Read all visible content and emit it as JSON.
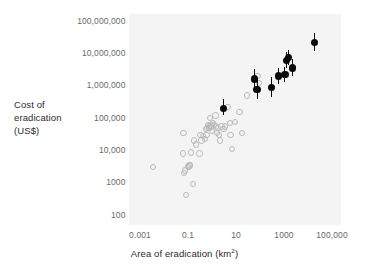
{
  "figure": {
    "background_color": "#ffffff",
    "plot_background_color": "#f4f4f4",
    "filled_marker_color": "#0a0a0a",
    "open_marker_color": "#b9b9b9",
    "tick_label_color": "#6a6a6a",
    "axis_title_color": "#2b2b2b"
  },
  "chart_data": {
    "type": "scatter",
    "title": "",
    "xlabel": "Area of eradication (km²)",
    "ylabel_lines": [
      "Cost of",
      "eradication",
      "(US$)"
    ],
    "ylabel": "Cost of eradication (US$)",
    "xscale": "log",
    "yscale": "log",
    "xlim": [
      0.001,
      100000
    ],
    "ylim": [
      100,
      100000000
    ],
    "grid": false,
    "legend": null,
    "xticks": [
      0.001,
      0.1,
      10,
      1000,
      100000
    ],
    "xtick_labels": [
      "0.001",
      "0.1",
      "10",
      "1000",
      "100,000"
    ],
    "yticks": [
      100,
      1000,
      10000,
      100000,
      1000000,
      10000000,
      100000000
    ],
    "ytick_labels": [
      "100",
      "1000",
      "10,000",
      "100,000",
      "1,000,000",
      "10,000,000",
      "100,000,000"
    ],
    "series": [
      {
        "name": "open-circles",
        "marker": "open-circle",
        "points": [
          {
            "x": 0.0035,
            "y": 3000
          },
          {
            "x": 0.065,
            "y": 35000
          },
          {
            "x": 0.062,
            "y": 8000
          },
          {
            "x": 0.07,
            "y": 2000
          },
          {
            "x": 0.075,
            "y": 2400
          },
          {
            "x": 0.085,
            "y": 420
          },
          {
            "x": 0.1,
            "y": 3000
          },
          {
            "x": 0.105,
            "y": 3200
          },
          {
            "x": 0.115,
            "y": 3400
          },
          {
            "x": 0.12,
            "y": 3500
          },
          {
            "x": 0.13,
            "y": 8500
          },
          {
            "x": 0.16,
            "y": 900
          },
          {
            "x": 0.18,
            "y": 20000
          },
          {
            "x": 0.22,
            "y": 15000
          },
          {
            "x": 0.3,
            "y": 8000
          },
          {
            "x": 0.33,
            "y": 30000
          },
          {
            "x": 0.36,
            "y": 20000
          },
          {
            "x": 0.42,
            "y": 28000
          },
          {
            "x": 0.5,
            "y": 22000
          },
          {
            "x": 0.55,
            "y": 45000
          },
          {
            "x": 0.6,
            "y": 30000
          },
          {
            "x": 0.62,
            "y": 50000
          },
          {
            "x": 0.7,
            "y": 60000
          },
          {
            "x": 0.75,
            "y": 55000
          },
          {
            "x": 0.8,
            "y": 48000
          },
          {
            "x": 0.85,
            "y": 100000
          },
          {
            "x": 0.9,
            "y": 52000
          },
          {
            "x": 0.95,
            "y": 58000
          },
          {
            "x": 1.0,
            "y": 40000
          },
          {
            "x": 1.1,
            "y": 70000
          },
          {
            "x": 1.2,
            "y": 62000
          },
          {
            "x": 1.4,
            "y": 120000
          },
          {
            "x": 1.5,
            "y": 55000
          },
          {
            "x": 1.6,
            "y": 35000
          },
          {
            "x": 1.8,
            "y": 50000
          },
          {
            "x": 2.0,
            "y": 30000
          },
          {
            "x": 2.2,
            "y": 20000
          },
          {
            "x": 2.5,
            "y": 55000
          },
          {
            "x": 3.0,
            "y": 45000
          },
          {
            "x": 3.5,
            "y": 55000
          },
          {
            "x": 4.5,
            "y": 220000
          },
          {
            "x": 5.5,
            "y": 70000
          },
          {
            "x": 6.0,
            "y": 30000
          },
          {
            "x": 7.0,
            "y": 11000
          },
          {
            "x": 9.0,
            "y": 75000
          },
          {
            "x": 14.0,
            "y": 150000
          },
          {
            "x": 18.0,
            "y": 35000
          },
          {
            "x": 28.0,
            "y": 500000
          },
          {
            "x": 80.0,
            "y": 2000000
          },
          {
            "x": 90.0,
            "y": 1200000
          }
        ]
      },
      {
        "name": "filled-circles-with-error-bars",
        "marker": "filled-circle",
        "points": [
          {
            "x": 3.0,
            "y": 200000,
            "yerr_low": 120000,
            "yerr_high": 400000
          },
          {
            "x": 60.0,
            "y": 1600000,
            "yerr_low": 900000,
            "yerr_high": 3200000
          },
          {
            "x": 75.0,
            "y": 750000,
            "yerr_low": 380000,
            "yerr_high": 1500000
          },
          {
            "x": 300.0,
            "y": 900000,
            "yerr_low": 450000,
            "yerr_high": 1800000
          },
          {
            "x": 600.0,
            "y": 2000000,
            "yerr_low": 1100000,
            "yerr_high": 3600000
          },
          {
            "x": 1100.0,
            "y": 2200000,
            "yerr_low": 1300000,
            "yerr_high": 3800000
          },
          {
            "x": 1300.0,
            "y": 6000000,
            "yerr_low": 3500000,
            "yerr_high": 11000000
          },
          {
            "x": 1600.0,
            "y": 7500000,
            "yerr_low": 4500000,
            "yerr_high": 13000000
          },
          {
            "x": 2200.0,
            "y": 3500000,
            "yerr_low": 2000000,
            "yerr_high": 6500000
          },
          {
            "x": 18000.0,
            "y": 22000000,
            "yerr_low": 12000000,
            "yerr_high": 42000000
          }
        ]
      }
    ]
  }
}
